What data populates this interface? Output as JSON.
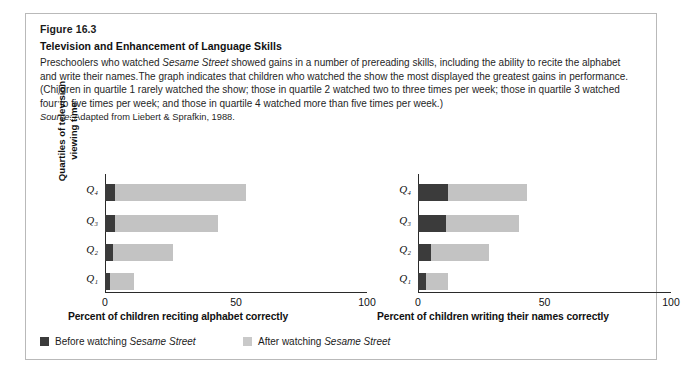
{
  "figure": {
    "number": "Figure 16.3",
    "title": "Television and Enhancement of Language Skills",
    "caption_parts": [
      {
        "text": "Preschoolers who watched ",
        "style": "normal"
      },
      {
        "text": "Sesame Street",
        "style": "italic"
      },
      {
        "text": " showed gains in a number of prereading skills, including the ability to recite the alphabet and write their names.The graph indicates that children who watched the show the most displayed the greatest gains in performance. (Children in quartile 1 rarely watched the show; those in quartile 2 watched two to three times per week; those in quartile 3 watched four to five times per week; and those in quartile 4 watched more than five times per week.)",
        "style": "normal"
      }
    ],
    "caption_plain": "Preschoolers who watched Sesame Street showed gains in a number of prereading skills, including the ability to recite the alphabet and write their names.The graph indicates that children who watched the show the most displayed the greatest gains in performance. (Children in quartile 1 rarely watched the show; those in quartile 2 watched two to three times per week; those in quartile 3 watched four to five times per week; and those in quartile 4 watched more than five times per week.)",
    "source_label": "Source:",
    "source_text": " Adapted from Liebert & Sprafkin, 1988."
  },
  "legend": {
    "items": [
      {
        "label_prefix": "Before watching ",
        "label_italic": "Sesame Street",
        "color": "#3b3b3b",
        "name": "before"
      },
      {
        "label_prefix": "After watching ",
        "label_italic": "Sesame Street",
        "color": "#c9c9c9",
        "name": "after"
      }
    ]
  },
  "y_axis_group_label": "Quartiles of television viewing time",
  "chart_data": [
    {
      "type": "bar",
      "orientation": "horizontal",
      "stacked": true,
      "id": "reciting-alphabet",
      "title": "",
      "xlabel": "Percent of children reciting alphabet correctly",
      "ylabel": "Quartiles of television viewing time",
      "categories": [
        "Q₁",
        "Q₂",
        "Q₃",
        "Q₄"
      ],
      "category_order_top_to_bottom": [
        "Q₄",
        "Q₃",
        "Q₂",
        "Q₁"
      ],
      "xlim": [
        0,
        100
      ],
      "xticks": [
        0,
        50,
        100
      ],
      "xtick_labels": [
        "0",
        "50",
        "100"
      ],
      "grid": false,
      "legend_position": "bottom",
      "series": [
        {
          "name": "Before watching Sesame Street",
          "color": "#3b3b3b",
          "values": [
            2,
            3,
            4,
            4
          ]
        },
        {
          "name": "After watching Sesame Street",
          "color": "#c3c3c3",
          "values": [
            9,
            23,
            39,
            50
          ]
        }
      ],
      "totals": [
        11,
        26,
        43,
        54
      ]
    },
    {
      "type": "bar",
      "orientation": "horizontal",
      "stacked": true,
      "id": "writing-names",
      "title": "",
      "xlabel": "Percent of children writing their names correctly",
      "ylabel": "Quartiles of television viewing time",
      "categories": [
        "Q₁",
        "Q₂",
        "Q₃",
        "Q₄"
      ],
      "category_order_top_to_bottom": [
        "Q₄",
        "Q₃",
        "Q₂",
        "Q₁"
      ],
      "xlim": [
        0,
        100
      ],
      "xticks": [
        0,
        50,
        100
      ],
      "xtick_labels": [
        "0",
        "50",
        "100"
      ],
      "grid": false,
      "legend_position": "bottom",
      "series": [
        {
          "name": "Before watching Sesame Street",
          "color": "#3b3b3b",
          "values": [
            3,
            5,
            11,
            12
          ]
        },
        {
          "name": "After watching Sesame Street",
          "color": "#c3c3c3",
          "values": [
            9,
            23,
            29,
            31
          ]
        }
      ],
      "totals": [
        12,
        28,
        40,
        43
      ]
    }
  ],
  "colors": {
    "before": "#3b3b3b",
    "after": "#c3c3c3",
    "axis": "#2a2a2a",
    "border": "#b9b9b9",
    "text": "#1a1a1a"
  }
}
